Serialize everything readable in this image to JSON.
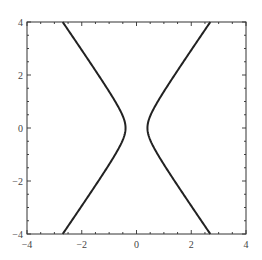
{
  "chart_data": {
    "type": "line",
    "title": "",
    "xlabel": "",
    "ylabel": "",
    "xlim": [
      -4,
      4
    ],
    "ylim": [
      -4,
      4
    ],
    "grid": false,
    "legend": null,
    "x_ticks": [
      -4,
      -2,
      0,
      2,
      4
    ],
    "y_ticks": [
      -4,
      -2,
      0,
      2,
      4
    ],
    "x_tick_labels": [
      "−4",
      "−2",
      "0",
      "2",
      "4"
    ],
    "y_tick_labels": [
      "−4",
      "−2",
      "0",
      "2",
      "4"
    ],
    "hyperbola": {
      "a": 0.4,
      "b": 0.6
    },
    "series": [
      {
        "name": "left-branch",
        "color": "#222222",
        "points": [
          [
            -2.7,
            4
          ],
          [
            -2.03,
            3
          ],
          [
            -1.39,
            2
          ],
          [
            -0.8,
            1
          ],
          [
            -0.5,
            0.5
          ],
          [
            -0.4,
            0
          ],
          [
            -0.5,
            -0.5
          ],
          [
            -0.8,
            -1
          ],
          [
            -1.39,
            -2
          ],
          [
            -2.03,
            -3
          ],
          [
            -2.7,
            -4
          ]
        ]
      },
      {
        "name": "right-branch",
        "color": "#222222",
        "points": [
          [
            2.7,
            4
          ],
          [
            2.03,
            3
          ],
          [
            1.39,
            2
          ],
          [
            0.8,
            1
          ],
          [
            0.5,
            0.5
          ],
          [
            0.4,
            0
          ],
          [
            0.5,
            -0.5
          ],
          [
            0.8,
            -1
          ],
          [
            1.39,
            -2
          ],
          [
            2.03,
            -3
          ],
          [
            2.7,
            -4
          ]
        ]
      }
    ]
  },
  "frame": {
    "left": 27,
    "top": 22,
    "right": 246,
    "bottom": 234
  }
}
